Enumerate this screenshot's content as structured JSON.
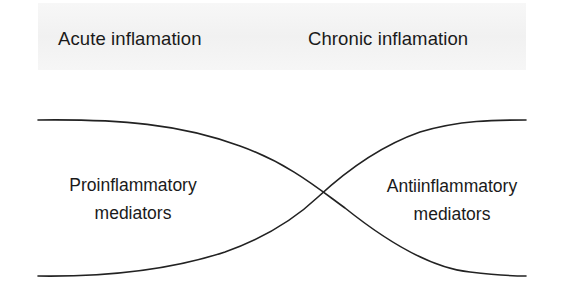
{
  "diagram": {
    "header": {
      "left_phase": "Acute inflamation",
      "right_phase": "Chronic inflamation"
    },
    "regions": {
      "left": {
        "line1": "Proinflammatory",
        "line2": "mediators"
      },
      "right": {
        "line1": "Antiinflammatory",
        "line2": "mediators"
      }
    },
    "colors": {
      "line": "#222222",
      "header_band": "#f3f3f3",
      "text": "#1a1a1a"
    }
  }
}
